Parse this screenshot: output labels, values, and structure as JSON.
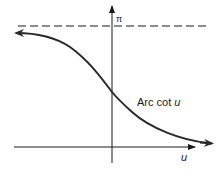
{
  "figure": {
    "curve_label_main": "Arc cot ",
    "curve_label_var": "u",
    "x_axis_label": "u",
    "asymptote_label": "π"
  },
  "colors": {
    "ink": "#1a1a1a",
    "curve": "#2a2a2a",
    "background": "#ffffff"
  }
}
